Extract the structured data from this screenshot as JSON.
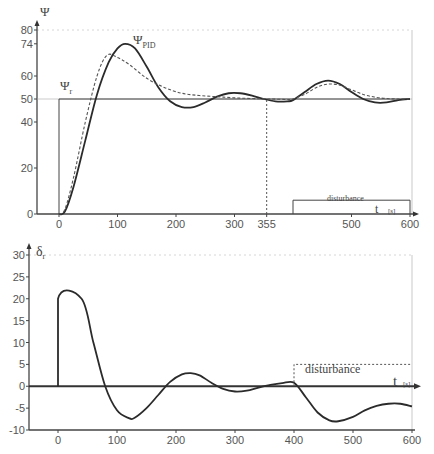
{
  "chart_data": [
    {
      "type": "line",
      "title": "",
      "ylabel": "Ψ",
      "xlabel": "t [s]",
      "xlim": [
        -40,
        610
      ],
      "ylim": [
        0,
        80
      ],
      "x_ticks": [
        0,
        100,
        200,
        300,
        355,
        500,
        600
      ],
      "y_ticks": [
        0,
        20,
        40,
        50,
        60,
        74,
        80
      ],
      "grid": false,
      "annotations": [
        {
          "text": "Ψ_PID",
          "x": 130,
          "y": 70
        },
        {
          "text": "Ψ_r",
          "x": 5,
          "y": 55
        },
        {
          "text": "disturbance",
          "x": 420,
          "y": 10
        },
        {
          "text": "t [s]",
          "x": 560,
          "y": 3
        }
      ],
      "series": [
        {
          "name": "Ψ_r (setpoint)",
          "style": "solid-thin",
          "x": [
            0,
            0,
            600
          ],
          "y": [
            0,
            50,
            50
          ]
        },
        {
          "name": "Ψ_PID",
          "style": "solid",
          "x": [
            0,
            10,
            25,
            45,
            65,
            85,
            100,
            113,
            130,
            150,
            170,
            190,
            210,
            230,
            250,
            270,
            290,
            310,
            330,
            350,
            370,
            390,
            400,
            420,
            440,
            460,
            480,
            500,
            520,
            540,
            560,
            580,
            600
          ],
          "y": [
            0,
            1,
            12,
            32,
            52,
            66,
            72,
            74,
            72,
            64,
            55,
            49,
            46.5,
            46.5,
            48.5,
            51,
            52.5,
            52.5,
            51.5,
            50,
            49,
            49,
            49.5,
            53,
            56.5,
            58,
            56.5,
            53,
            50,
            48.5,
            48.5,
            49.5,
            50
          ]
        },
        {
          "name": "Ψ (dashed)",
          "style": "dashed",
          "x": [
            0,
            10,
            25,
            45,
            65,
            82,
            100,
            120,
            150,
            180,
            210,
            240,
            270,
            300,
            330,
            360,
            390,
            400,
            420,
            440,
            460,
            480,
            500,
            520,
            540,
            560,
            580,
            600
          ],
          "y": [
            0,
            2,
            16,
            40,
            60,
            69,
            68,
            65,
            59,
            55,
            52.5,
            51.5,
            51,
            50.5,
            50.2,
            50,
            49.8,
            50,
            52,
            55,
            56.5,
            56,
            54,
            52,
            50.8,
            50.2,
            50,
            50
          ]
        },
        {
          "name": "t=355 marker",
          "style": "dotted",
          "x": [
            355,
            355
          ],
          "y": [
            0,
            50
          ]
        },
        {
          "name": "disturbance",
          "style": "solid-thin",
          "x": [
            400,
            400,
            600,
            600
          ],
          "y": [
            0,
            6,
            6,
            0
          ]
        }
      ]
    },
    {
      "type": "line",
      "title": "",
      "ylabel": "δr",
      "xlabel": "t [s]",
      "xlim": [
        -50,
        610
      ],
      "ylim": [
        -10,
        30
      ],
      "x_ticks": [
        0,
        100,
        200,
        300,
        400,
        500,
        600
      ],
      "y_ticks": [
        -10,
        -5,
        0,
        5,
        10,
        15,
        20,
        25,
        30
      ],
      "grid": false,
      "annotations": [
        {
          "text": "disturbance",
          "x": 450,
          "y": 6.5
        },
        {
          "text": "t [s]",
          "x": 560,
          "y": 1
        }
      ],
      "series": [
        {
          "name": "δr",
          "style": "solid",
          "x": [
            0,
            0,
            40,
            60,
            80,
            100,
            120,
            130,
            150,
            170,
            190,
            210,
            225,
            240,
            260,
            280,
            300,
            320,
            340,
            360,
            380,
            400,
            420,
            440,
            460,
            475,
            500,
            520,
            540,
            560,
            580,
            600
          ],
          "y": [
            0,
            20,
            20,
            10,
            0,
            -5.5,
            -7.3,
            -7.2,
            -5,
            -2,
            1,
            2.7,
            3,
            2.5,
            0.8,
            -0.6,
            -1.2,
            -1,
            -0.3,
            0.3,
            0.7,
            0.8,
            -2.5,
            -6,
            -7.8,
            -8,
            -7,
            -5.5,
            -4.5,
            -4,
            -4,
            -4.6
          ]
        },
        {
          "name": "disturbance",
          "style": "dotted",
          "x": [
            400,
            400,
            600
          ],
          "y": [
            0,
            5,
            5
          ]
        }
      ]
    }
  ],
  "labels": {
    "top_y_axis": "Ψ",
    "top_curve": "Ψ",
    "top_curve_sub": "PID",
    "setpoint": "Ψ",
    "setpoint_sub": "r",
    "top_disturbance": "disturbance",
    "top_t": "t",
    "top_t_unit": "[s]",
    "bottom_y_axis": "δ",
    "bottom_y_axis_sub": "r",
    "bottom_disturbance": "disturbance",
    "bottom_t": "t",
    "bottom_t_unit": "[s]"
  }
}
